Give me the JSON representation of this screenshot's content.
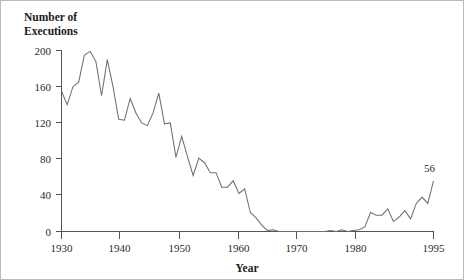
{
  "chart_data": {
    "type": "line",
    "title": "",
    "ylabel": "Number of\nExecutions",
    "ylabel_line1": "Number of",
    "ylabel_line2": "Executions",
    "xlabel": "Year",
    "xlim": [
      1930,
      1995
    ],
    "ylim": [
      0,
      200
    ],
    "grid": false,
    "legend": null,
    "yticks": [
      0,
      40,
      80,
      120,
      160,
      200
    ],
    "ytick_labels": [
      "0",
      "40",
      "80",
      "120",
      "160",
      "200"
    ],
    "xticks": [
      1930,
      1940,
      1950,
      1960,
      1970,
      1980,
      1995
    ],
    "xtick_labels": [
      "1930",
      "1940",
      "1950",
      "1960",
      "1970",
      "1980",
      "1995"
    ],
    "annotations": [
      {
        "text": "56",
        "x": 1995,
        "y": 56
      }
    ],
    "series": [
      {
        "name": "Executions",
        "x": [
          1930,
          1931,
          1932,
          1933,
          1934,
          1935,
          1936,
          1937,
          1938,
          1939,
          1940,
          1941,
          1942,
          1943,
          1944,
          1945,
          1946,
          1947,
          1948,
          1949,
          1950,
          1951,
          1952,
          1953,
          1954,
          1955,
          1956,
          1957,
          1958,
          1959,
          1960,
          1961,
          1962,
          1963,
          1964,
          1965,
          1966,
          1967,
          1968,
          1969,
          1970,
          1971,
          1972,
          1973,
          1974,
          1975,
          1976,
          1977,
          1978,
          1979,
          1980,
          1981,
          1982,
          1983,
          1984,
          1985,
          1986,
          1987,
          1988,
          1989,
          1990,
          1991,
          1992,
          1993,
          1994,
          1995
        ],
        "values": [
          155,
          140,
          160,
          165,
          195,
          199,
          188,
          150,
          190,
          160,
          124,
          123,
          147,
          131,
          120,
          117,
          131,
          153,
          119,
          120,
          82,
          105,
          83,
          62,
          81,
          76,
          65,
          65,
          49,
          49,
          56,
          42,
          47,
          21,
          15,
          7,
          1,
          2,
          0,
          0,
          0,
          0,
          0,
          0,
          0,
          0,
          0,
          1,
          0,
          2,
          0,
          1,
          2,
          5,
          21,
          18,
          18,
          25,
          11,
          16,
          23,
          14,
          31,
          38,
          31,
          56
        ]
      }
    ]
  },
  "labels": {
    "y_axis_title_line1": "Number of",
    "y_axis_title_line2": "Executions",
    "x_axis_title": "Year",
    "end_value": "56"
  },
  "colors": {
    "line": "#6f6f6f",
    "axis": "#555555",
    "text": "#2b2b2b",
    "title_text": "#1a1a1a",
    "background": "#ffffff",
    "border": "#b9b9b9"
  }
}
